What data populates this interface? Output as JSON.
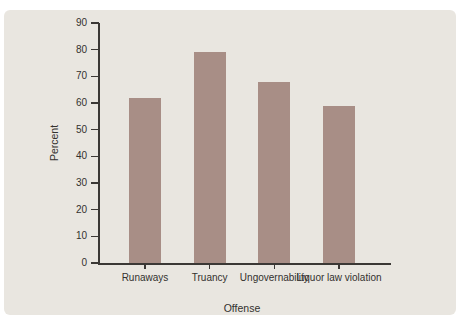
{
  "chart_data": {
    "type": "bar",
    "title": "",
    "categories": [
      "Runaways",
      "Truancy",
      "Ungovernability",
      "Liquor law violation"
    ],
    "values": [
      62,
      79,
      68,
      59
    ],
    "xlabel": "Offense",
    "ylabel": "Percent",
    "ylim": [
      0,
      90
    ],
    "ytick_interval": 10,
    "yticks": [
      0,
      10,
      20,
      30,
      40,
      50,
      60,
      70,
      80,
      90
    ],
    "grid": false,
    "legend": "none",
    "colors": {
      "panel_background": "#e9e6e0",
      "page_background": "#ffffff",
      "bar_fill": "#a88e86",
      "axis_line": "#3b3835",
      "text": "#33312e"
    }
  }
}
